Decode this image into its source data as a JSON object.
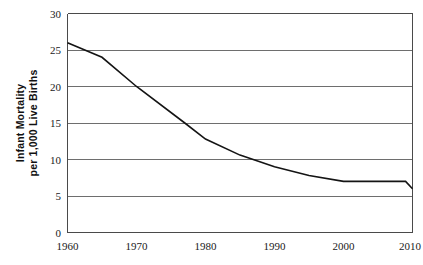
{
  "chart_data": {
    "type": "line",
    "title": "",
    "xlabel": "",
    "ylabel_line1": "Infant Mortality",
    "ylabel_line2": "per 1,000 Live Births",
    "xlim": [
      1960,
      2010
    ],
    "ylim": [
      0,
      30
    ],
    "xticks": [
      "1960",
      "1970",
      "1980",
      "1990",
      "2000",
      "2010"
    ],
    "yticks": [
      "0",
      "5",
      "10",
      "15",
      "20",
      "25",
      "30"
    ],
    "grid": "horizontal",
    "legend": "none",
    "line_color": "#141414",
    "grid_color": "#6e6e6e",
    "series": [
      {
        "name": "Infant mortality rate",
        "x": [
          1960,
          1965,
          1970,
          1977,
          1980,
          1985,
          1990,
          1995,
          2000,
          2005,
          2009,
          2010
        ],
        "values": [
          26.0,
          24.0,
          20.0,
          15.0,
          12.8,
          10.6,
          9.0,
          7.8,
          7.0,
          7.0,
          7.0,
          6.0
        ]
      }
    ]
  },
  "axes": {
    "y_tick_0": "0",
    "y_tick_5": "5",
    "y_tick_10": "10",
    "y_tick_15": "15",
    "y_tick_20": "20",
    "y_tick_25": "25",
    "y_tick_30": "30",
    "x_tick_1960": "1960",
    "x_tick_1970": "1970",
    "x_tick_1980": "1980",
    "x_tick_1990": "1990",
    "x_tick_2000": "2000",
    "x_tick_2010": "2010"
  }
}
